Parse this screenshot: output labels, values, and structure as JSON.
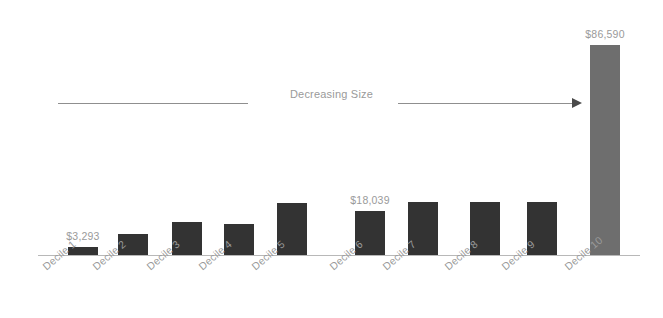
{
  "chart_data": {
    "type": "bar",
    "title": "",
    "subtitle": "",
    "xlabel": "",
    "ylabel": "",
    "grid": false,
    "legend": null,
    "ylim": [
      0,
      86590
    ],
    "categories": [
      "Decile 1",
      "Decile 2",
      "Decile 3",
      "Decile 4",
      "Decile 5",
      "Decile 6",
      "Decile 7",
      "Decile 8",
      "Decile 9",
      "Decile 10"
    ],
    "values": [
      3293,
      8700,
      13600,
      12800,
      21400,
      18039,
      21800,
      21800,
      21800,
      86590
    ],
    "value_labels": [
      {
        "category": "Decile 1",
        "text": "$3,293"
      },
      {
        "category": "Decile 6",
        "text": "$18,039"
      },
      {
        "category": "Decile 10",
        "text": "$86,590"
      }
    ],
    "annotations": [
      {
        "text": "Decreasing Size",
        "direction": "right-arrow"
      }
    ],
    "colors": {
      "bar": "#333333",
      "bar_highlight": "#6e6e6e",
      "axis": "#b8b8b8",
      "label_text": "#9a9a9a",
      "annotation_line": "#8f8f8f",
      "annotation_arrow": "#4a4a4a",
      "background": "#ffffff"
    },
    "highlight_category": "Decile 10"
  },
  "bars": [
    {
      "label": "Decile 1",
      "value": 3293,
      "value_text": "$3,293",
      "x": 68,
      "top": 247,
      "height": 8,
      "highlight": false,
      "show_value": true
    },
    {
      "label": "Decile 2",
      "value": 8700,
      "value_text": "",
      "x": 118,
      "top": 234,
      "height": 21,
      "highlight": false,
      "show_value": false
    },
    {
      "label": "Decile 3",
      "value": 13600,
      "value_text": "",
      "x": 172,
      "top": 222,
      "height": 33,
      "highlight": false,
      "show_value": false
    },
    {
      "label": "Decile 4",
      "value": 12800,
      "value_text": "",
      "x": 224,
      "top": 224,
      "height": 31,
      "highlight": false,
      "show_value": false
    },
    {
      "label": "Decile 5",
      "value": 21400,
      "value_text": "",
      "x": 277,
      "top": 203,
      "height": 52,
      "highlight": false,
      "show_value": false
    },
    {
      "label": "Decile 6",
      "value": 18039,
      "value_text": "$18,039",
      "x": 355,
      "top": 211,
      "height": 44,
      "highlight": false,
      "show_value": true
    },
    {
      "label": "Decile 7",
      "value": 21800,
      "value_text": "",
      "x": 408,
      "top": 202,
      "height": 53,
      "highlight": false,
      "show_value": false
    },
    {
      "label": "Decile 8",
      "value": 21800,
      "value_text": "",
      "x": 470,
      "top": 202,
      "height": 53,
      "highlight": false,
      "show_value": false
    },
    {
      "label": "Decile 9",
      "value": 21800,
      "value_text": "",
      "x": 527,
      "top": 202,
      "height": 53,
      "highlight": false,
      "show_value": false
    },
    {
      "label": "Decile 10",
      "value": 86590,
      "value_text": "$86,590",
      "x": 590,
      "top": 45,
      "height": 210,
      "highlight": true,
      "show_value": true
    }
  ],
  "annotation": {
    "text": "Decreasing Size"
  }
}
